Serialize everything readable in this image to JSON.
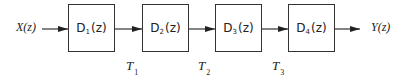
{
  "diagram": {
    "type": "block-diagram-cascade",
    "input": {
      "label": "X(z)"
    },
    "output": {
      "label": "Y(z)"
    },
    "blocks": [
      {
        "main": "D",
        "sub": "1",
        "arg": "(z)"
      },
      {
        "main": "D",
        "sub": "2",
        "arg": "(z)"
      },
      {
        "main": "D",
        "sub": "3",
        "arg": "(z)"
      },
      {
        "main": "D",
        "sub": "4",
        "arg": "(z)"
      }
    ],
    "taps": [
      {
        "main": "T",
        "sub": "1"
      },
      {
        "main": "T",
        "sub": "2"
      },
      {
        "main": "T",
        "sub": "3"
      }
    ],
    "colors": {
      "stroke": "#333333",
      "text": "#222222",
      "background": "#ffffff"
    }
  }
}
